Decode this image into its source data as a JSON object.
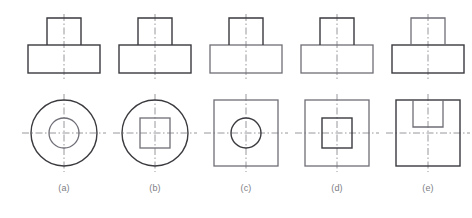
{
  "figure": {
    "type": "engineering-orthographic-projection-set",
    "background_color": "#ffffff",
    "canvas": {
      "width": 472,
      "height": 218
    },
    "style": {
      "outline_color": "#3a3a3f",
      "outline_color_light": "#6e6e76",
      "centerline_color": "#8c8c93",
      "caption_color": "#7d7d84",
      "outline_width": 1.4,
      "centerline_width": 0.9,
      "centerline_dash": "7 2.5 1.5 2.5"
    },
    "captions": [
      {
        "label": "(a)",
        "cx": 64
      },
      {
        "label": "(b)",
        "cx": 155
      },
      {
        "label": "(c)",
        "cx": 246
      },
      {
        "label": "(d)",
        "cx": 337
      },
      {
        "label": "(e)",
        "cx": 428
      }
    ],
    "front_view_common": {
      "description": "T-shaped front elevation: narrow upright block on wide base block",
      "base": {
        "width": 72,
        "height": 28,
        "top_y": 45
      },
      "upright": {
        "width": 34,
        "height": 27,
        "top_y": 18
      }
    },
    "items": [
      {
        "id": "a",
        "caption": "(a)",
        "center_x": 64,
        "front_view": {
          "name": "t-shape-front-view"
        },
        "top_view": {
          "name": "circle-in-circle-top-view",
          "center_y": 133,
          "outer": {
            "shape": "circle",
            "radius": 33
          },
          "inner": {
            "shape": "circle",
            "radius": 15
          }
        }
      },
      {
        "id": "b",
        "caption": "(b)",
        "center_x": 155,
        "front_view": {
          "name": "t-shape-front-view"
        },
        "top_view": {
          "name": "square-in-circle-top-view",
          "center_y": 133,
          "outer": {
            "shape": "circle",
            "radius": 33
          },
          "inner": {
            "shape": "square",
            "size": 30
          }
        }
      },
      {
        "id": "c",
        "caption": "(c)",
        "center_x": 246,
        "front_view": {
          "name": "t-shape-front-view"
        },
        "top_view": {
          "name": "circle-in-square-top-view",
          "center_y": 133,
          "outer": {
            "shape": "square",
            "width": 64,
            "height": 66
          },
          "inner": {
            "shape": "circle",
            "radius": 15
          }
        }
      },
      {
        "id": "d",
        "caption": "(d)",
        "center_x": 337,
        "front_view": {
          "name": "t-shape-front-view"
        },
        "top_view": {
          "name": "square-in-square-top-view",
          "center_y": 133,
          "outer": {
            "shape": "square",
            "width": 64,
            "height": 66
          },
          "inner": {
            "shape": "square",
            "size": 30
          }
        }
      },
      {
        "id": "e",
        "caption": "(e)",
        "center_x": 428,
        "front_view": {
          "name": "t-shape-front-view"
        },
        "top_view": {
          "name": "notch-in-square-top-view",
          "center_y": 133,
          "outer": {
            "shape": "square",
            "width": 64,
            "height": 66
          },
          "inner": {
            "shape": "open-top-rectangle-notch",
            "width": 30,
            "depth": 27
          }
        }
      }
    ]
  }
}
